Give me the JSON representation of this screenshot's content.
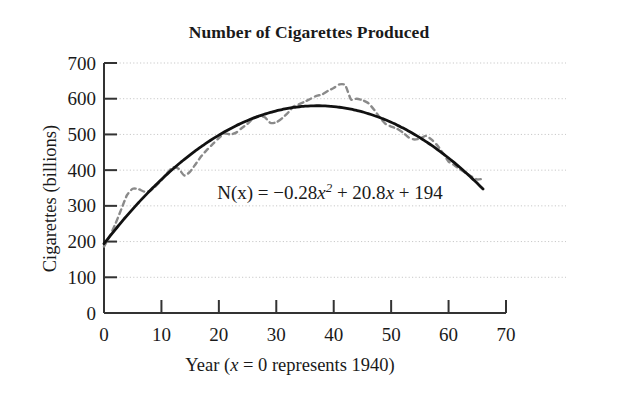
{
  "chart_data": {
    "type": "line",
    "title": "Number of Cigarettes Produced",
    "xlabel": "Year (x = 0 represents 1940)",
    "ylabel": "Cigarettes (billions)",
    "xlim": [
      0,
      70
    ],
    "ylim": [
      0,
      700
    ],
    "xticks": [
      0,
      10,
      20,
      30,
      40,
      50,
      60,
      70
    ],
    "yticks": [
      0,
      100,
      200,
      300,
      400,
      500,
      600,
      700
    ],
    "grid": "horizontal-dotted",
    "legend": "none",
    "annotations": [
      {
        "name": "model-equation",
        "text": "N(x) = −0.28x² + 20.8x + 194",
        "lead": "N(x) = −0.28",
        "var1": "x",
        "exp1": "2",
        "mid": " + 20.8",
        "var2": "x",
        "tail": " + 194"
      }
    ],
    "series": [
      {
        "name": "Quadratic model N(x)",
        "style": "solid",
        "color": "#111111",
        "width": 2.8,
        "equation": "N(x) = -0.28x^2 + 20.8x + 194",
        "x": [
          0,
          2,
          4,
          6,
          8,
          10,
          12,
          14,
          16,
          18,
          20,
          22,
          24,
          26,
          28,
          30,
          32,
          34,
          36,
          38,
          40,
          42,
          44,
          46,
          48,
          50,
          52,
          54,
          56,
          58,
          60,
          62,
          64,
          66
        ],
        "values": [
          194,
          234.5,
          273.1,
          309.9,
          276.8,
          374,
          405.7,
          430.1,
          454.3,
          476.3,
          496,
          513.5,
          528.7,
          541.7,
          552.5,
          561,
          567.3,
          571.4,
          573.3,
          572.9,
          570.4,
          565.6,
          558.6,
          549.4,
          538,
          524,
          508.6,
          490.5,
          470.2,
          447.7,
          423,
          396,
          366.9,
          335.5
        ]
      },
      {
        "name": "Actual production data",
        "style": "dashed",
        "color": "#8a8a8a",
        "width": 2.4,
        "x": [
          0,
          1,
          2,
          3,
          4,
          5,
          6,
          7,
          8,
          9,
          10,
          11,
          12,
          13,
          14,
          15,
          16,
          17,
          18,
          19,
          20,
          21,
          22,
          23,
          24,
          25,
          26,
          27,
          28,
          29,
          30,
          31,
          32,
          33,
          34,
          35,
          36,
          37,
          38,
          39,
          40,
          41,
          42,
          43,
          44,
          45,
          46,
          47,
          48,
          49,
          50,
          51,
          52,
          53,
          54,
          55,
          56,
          57,
          58,
          59,
          60,
          61,
          62,
          63,
          64,
          65,
          66
        ],
        "values": [
          186,
          215,
          250,
          290,
          330,
          348,
          347,
          340,
          342,
          355,
          372,
          392,
          408,
          404,
          385,
          396,
          418,
          440,
          458,
          474,
          490,
          503,
          500,
          505,
          518,
          530,
          545,
          552,
          548,
          532,
          534,
          545,
          560,
          578,
          585,
          592,
          600,
          608,
          612,
          622,
          630,
          640,
          638,
          598,
          600,
          596,
          588,
          570,
          548,
          530,
          522,
          516,
          506,
          492,
          486,
          488,
          496,
          486,
          470,
          448,
          424,
          414,
          402,
          392,
          382,
          374,
          376
        ]
      }
    ]
  },
  "axis": {
    "y_tick_labels": [
      "700",
      "600",
      "500",
      "400",
      "300",
      "200",
      "100",
      "0"
    ],
    "x_tick_labels": [
      "0",
      "10",
      "20",
      "30",
      "40",
      "50",
      "60",
      "70"
    ]
  },
  "colors": {
    "model_line": "#111111",
    "data_line": "#8a8a8a",
    "grid": "#c9c9c9",
    "axis": "#333333",
    "text": "#1a1a1a",
    "background": "#ffffff"
  }
}
